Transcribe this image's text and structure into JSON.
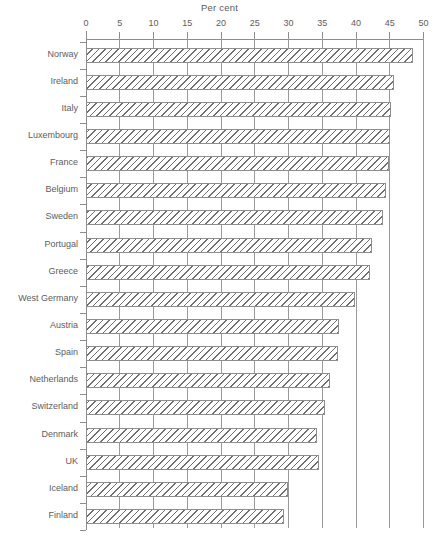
{
  "chart_data": {
    "type": "bar",
    "orientation": "horizontal",
    "title": "Per cent",
    "xlabel": "Per cent",
    "ylabel": "",
    "xlim": [
      0,
      50
    ],
    "xticks": [
      0,
      5,
      10,
      15,
      20,
      25,
      30,
      35,
      40,
      45,
      50
    ],
    "grid": true,
    "legend": false,
    "categories": [
      "Norway",
      "Ireland",
      "Italy",
      "Luxembourg",
      "France",
      "Belgium",
      "Sweden",
      "Portugal",
      "Greece",
      "West Germany",
      "Austria",
      "Spain",
      "Netherlands",
      "Switzerland",
      "Denmark",
      "UK",
      "Iceland",
      "Finland"
    ],
    "values": [
      48.4,
      45.7,
      45.2,
      45.0,
      44.9,
      44.4,
      44.0,
      42.3,
      42.0,
      39.8,
      37.5,
      37.3,
      36.1,
      35.4,
      34.2,
      34.5,
      29.9,
      29.3
    ]
  },
  "style": {
    "bar_fill": "hatched",
    "bar_edge_color": "#8e8e8e",
    "axis_color": "#8d8d8d",
    "text_color": "#5d5d5d",
    "background": "#ffffff"
  }
}
